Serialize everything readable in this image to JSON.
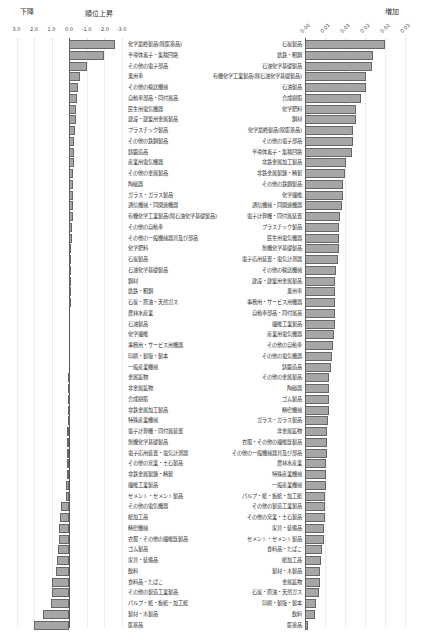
{
  "chart_data": [
    {
      "type": "bar",
      "orientation": "horizontal",
      "title_left": "下降",
      "title_right": "順位上昇",
      "xlim": [
        3.0,
        -3.0
      ],
      "tick_labels": [
        "3.0",
        "2.0",
        "1.0",
        "0.0",
        "-1.0",
        "-2.0",
        "-3.0"
      ],
      "ticks": [
        3.0,
        2.0,
        1.0,
        0.0,
        -1.0,
        -2.0,
        -3.0
      ],
      "grid": true,
      "categories": [
        "化学最終製品(除医薬品)",
        "半導体素子・集積回路",
        "その他の電子部品",
        "乗用車",
        "その他の輸送機械",
        "自動車部品・同付属品",
        "民生用電気機器",
        "建設・建築用金属製品",
        "プラスチック製品",
        "その他の鉄鋼製品",
        "鋳鍛造品",
        "産業用電気機器",
        "その他の金属製品",
        "陶磁器",
        "ガラス・ガラス製品",
        "通信機械・同関連機器",
        "有機化学工業製品(除石油化学基礎製品)",
        "その他の自動車",
        "その他の一般機械器具及び部品",
        "化学肥料",
        "石炭製品",
        "石油化学基礎製品",
        "鋼材",
        "銑鉄・粗鋼",
        "石炭・原油・天然ガス",
        "農林水産業",
        "石油製品",
        "化学繊維",
        "事務用・サービス用機器",
        "印刷・製版・製本",
        "一般産業機械",
        "金属鉱物",
        "非金属鉱物",
        "合成樹脂",
        "非鉄金属加工製品",
        "特殊産業機械",
        "電子計算機・同付属装置",
        "無機化学基礎製品",
        "電子応用装置・電気計測器",
        "その他の窯業・土石製品",
        "非鉄金属製錬・精製",
        "繊維工業製品",
        "セメント・セメント製品",
        "その他の電気機器",
        "紙加工品",
        "精密機械",
        "衣服・その他の繊維既製品",
        "ゴム製品",
        "家具・装備品",
        "飲料",
        "食料品・たばこ",
        "その他の製造工業製品",
        "パルプ・紙・板紙・加工紙",
        "製材・木製品",
        "医薬品"
      ],
      "values": [
        -2.6,
        -2.0,
        -1.0,
        -0.6,
        -0.5,
        -0.45,
        -0.4,
        -0.4,
        -0.35,
        -0.3,
        -0.3,
        -0.3,
        -0.25,
        -0.25,
        -0.2,
        -0.2,
        -0.2,
        -0.15,
        -0.15,
        -0.1,
        -0.1,
        -0.1,
        -0.05,
        -0.05,
        -0.05,
        0.0,
        0.0,
        0.0,
        0.0,
        0.0,
        0.0,
        0.05,
        0.05,
        0.05,
        0.05,
        0.05,
        0.1,
        0.1,
        0.1,
        0.1,
        0.1,
        0.15,
        0.2,
        0.45,
        0.5,
        0.55,
        0.6,
        0.65,
        0.7,
        0.75,
        0.95,
        1.0,
        1.05,
        1.5,
        2.0
      ]
    },
    {
      "type": "bar",
      "orientation": "horizontal",
      "title": "増加",
      "xlim": [
        0,
        0.025
      ],
      "tick_labels": [
        "0.00",
        "0.01",
        "0.01",
        "0.02",
        "0.02",
        "0.03"
      ],
      "ticks": [
        0,
        0.005,
        0.01,
        0.015,
        0.02,
        0.025
      ],
      "grid": true,
      "categories": [
        "石炭製品",
        "銑鉄・粗鋼",
        "石油化学基礎製品",
        "有機化学工業製品(除石油化学基礎製品)",
        "石油製品",
        "合成樹脂",
        "化学肥料",
        "鋼材",
        "化学最終製品(除医薬品)",
        "その他の電子部品",
        "半導体素子・集積回路",
        "非鉄金属加工製品",
        "非鉄金属製錬・精製",
        "その他の鉄鋼製品",
        "化学繊維",
        "通信機械・同関連機器",
        "電子計算機・同付属装置",
        "プラスチック製品",
        "民生用電気機器",
        "無機化学基礎製品",
        "電子応用装置・電気計測器",
        "その他の輸送機械",
        "建設・建築用金属製品",
        "乗用車",
        "事務用・サービス用機器",
        "自動車部品・同付属品",
        "繊維工業製品",
        "産業用電気機器",
        "その他の自動車",
        "その他の電気機器",
        "鋳鍛造品",
        "その他の金属製品",
        "陶磁器",
        "ゴム製品",
        "精密機械",
        "ガラス・ガラス製品",
        "非金属鉱物",
        "衣服・その他の繊維既製品",
        "その他の一般機械器具及び部品",
        "農林水産業",
        "特殊産業機械",
        "一般産業機械",
        "パルプ・紙・板紙・加工紙",
        "その他の製造工業製品",
        "その他の窯業・土石製品",
        "家具・装備品",
        "セメント・セメント製品",
        "食料品・たばこ",
        "紙加工品",
        "製材・木製品",
        "金属鉱物",
        "石炭・原油・天然ガス",
        "印刷・製版・製本",
        "飲料",
        "医薬品"
      ],
      "values": [
        0.02,
        0.017,
        0.0168,
        0.0153,
        0.0152,
        0.014,
        0.0128,
        0.0128,
        0.012,
        0.012,
        0.0118,
        0.0102,
        0.01,
        0.0095,
        0.0095,
        0.0092,
        0.0088,
        0.0085,
        0.0085,
        0.0085,
        0.0083,
        0.0078,
        0.0075,
        0.0075,
        0.0075,
        0.0075,
        0.0075,
        0.0072,
        0.007,
        0.0068,
        0.0065,
        0.006,
        0.006,
        0.006,
        0.006,
        0.0058,
        0.0055,
        0.0055,
        0.0055,
        0.0052,
        0.0052,
        0.0052,
        0.005,
        0.005,
        0.005,
        0.0048,
        0.0048,
        0.0042,
        0.004,
        0.0038,
        0.0038,
        0.0035,
        0.0028,
        0.0025,
        0.0008
      ]
    }
  ]
}
